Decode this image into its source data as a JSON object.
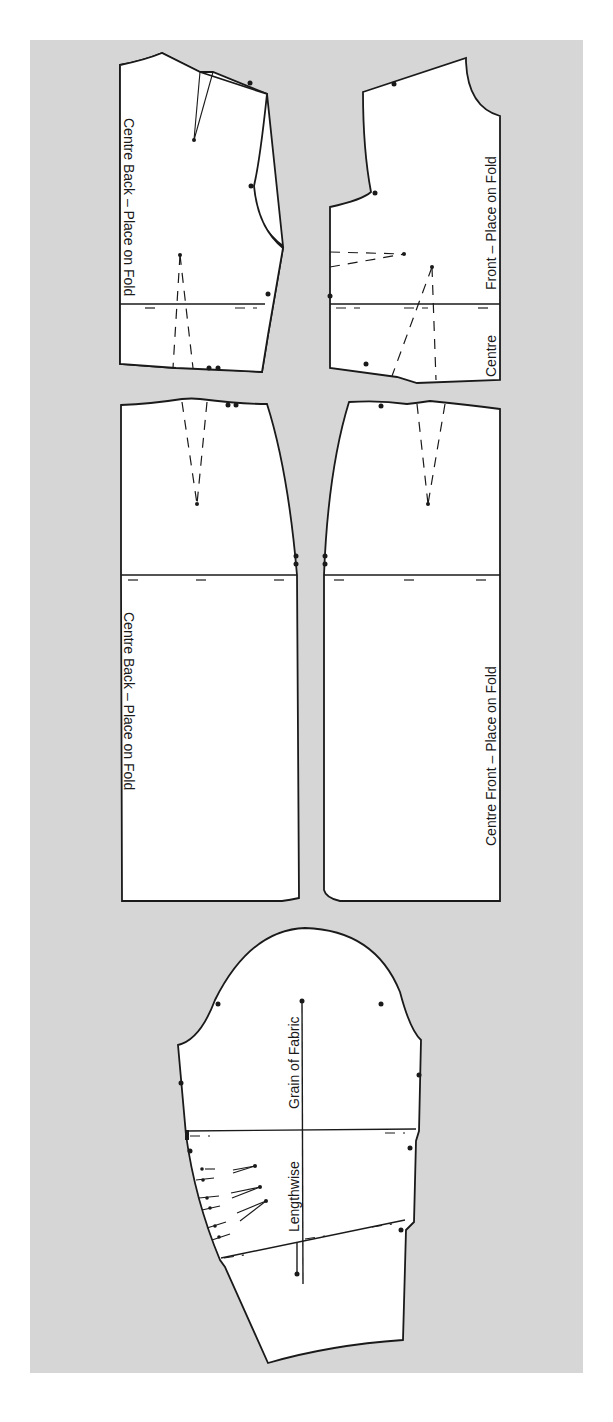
{
  "figure": {
    "type": "sewing-pattern-layout",
    "background_color": "#d6d6d6",
    "piece_fill": "#ffffff",
    "line_color": "#1a1a1a"
  },
  "pieces": {
    "back_bodice": {
      "label": "Centre Back – Place on Fold"
    },
    "front_bodice": {
      "label": "Front – Place on Fold",
      "label_bottom": "Centre"
    },
    "back_skirt": {
      "label": "Centre Back – Place on Fold"
    },
    "front_skirt": {
      "label": "Centre Front – Place on Fold"
    },
    "sleeve": {
      "grain_label_1": "Grain of Fabric",
      "grain_label_2": "Lengthwise"
    }
  }
}
